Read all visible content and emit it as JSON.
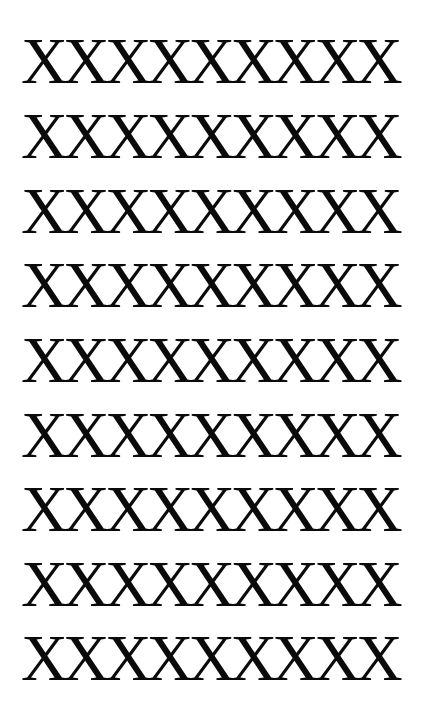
{
  "rows": [
    {
      "text": "XXXXXXXXX"
    },
    {
      "text": "XXXXXXXXX"
    },
    {
      "text": "XXXXXXXXX"
    },
    {
      "text": "XXXXXXXXX"
    },
    {
      "text": "XXXXXXXXX"
    },
    {
      "text": "XXXXXXXXX"
    },
    {
      "text": "XXXXXXXXX"
    },
    {
      "text": "XXXXXXXXX"
    },
    {
      "text": "XXXXXXXXX"
    }
  ],
  "colors": {
    "text": "#0a0a0a",
    "background": "#ffffff"
  }
}
